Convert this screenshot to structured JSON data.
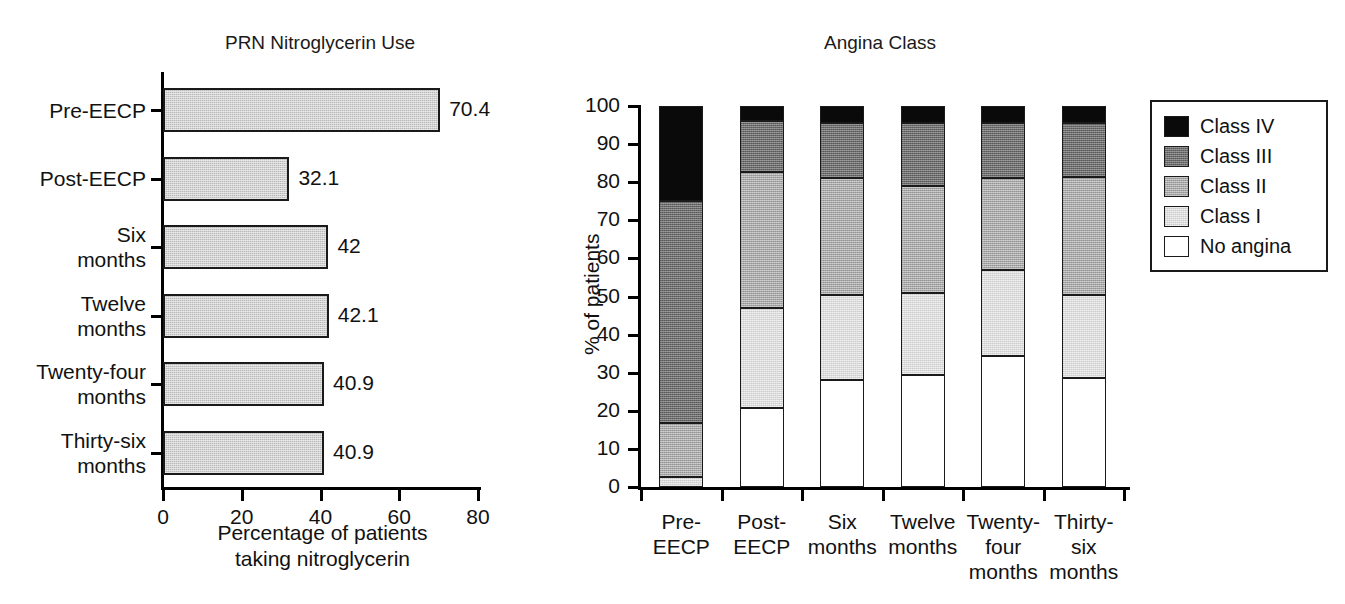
{
  "chart_data": [
    {
      "type": "bar",
      "orientation": "horizontal",
      "title": "PRN Nitroglycerin Use",
      "xlabel": "Percentage of patients taking nitroglycerin",
      "xlabel_line1": "Percentage of patients",
      "xlabel_line2": "taking nitroglycerin",
      "ylabel": "",
      "xlim": [
        0,
        80
      ],
      "xticks": [
        "0",
        "20",
        "40",
        "60",
        "80"
      ],
      "xtick_values": [
        0,
        20,
        40,
        60,
        80
      ],
      "grid": false,
      "legend": "none",
      "bar_color": "#b9b9b9",
      "categories": [
        "Pre-EECP",
        "Post-EECP",
        "Six months",
        "Twelve months",
        "Twenty-four months",
        "Thirty-six months"
      ],
      "category_lines": [
        [
          "Pre-EECP"
        ],
        [
          "Post-EECP"
        ],
        [
          "Six",
          "months"
        ],
        [
          "Twelve",
          "months"
        ],
        [
          "Twenty-four",
          "months"
        ],
        [
          "Thirty-six",
          "months"
        ]
      ],
      "values": [
        70.4,
        32.1,
        42,
        42.1,
        40.9,
        40.9
      ],
      "data_labels": [
        "70.4",
        "32.1",
        "42",
        "42.1",
        "40.9",
        "40.9"
      ]
    },
    {
      "type": "bar",
      "subtype": "stacked",
      "orientation": "vertical",
      "title": "Angina Class",
      "xlabel": "",
      "ylabel": "% of patients",
      "ylim": [
        0,
        100
      ],
      "yticks": [
        "0",
        "10",
        "20",
        "30",
        "40",
        "50",
        "60",
        "70",
        "80",
        "90",
        "100"
      ],
      "ytick_values": [
        0,
        10,
        20,
        30,
        40,
        50,
        60,
        70,
        80,
        90,
        100
      ],
      "grid": false,
      "legend_position": "right",
      "categories": [
        "Pre-EECP",
        "Post-EECP",
        "Six months",
        "Twelve months",
        "Twenty-four months",
        "Thirty-six months"
      ],
      "category_lines": [
        [
          "Pre-",
          "EECP"
        ],
        [
          "Post-",
          "EECP"
        ],
        [
          "Six",
          "months"
        ],
        [
          "Twelve",
          "months"
        ],
        [
          "Twenty-",
          "four",
          "months"
        ],
        [
          "Thirty-",
          "six",
          "months"
        ]
      ],
      "series": [
        {
          "name": "No angina",
          "color": "#ffffff",
          "swatch": "sw-0",
          "values": [
            0,
            20.8,
            28.0,
            29.4,
            34.3,
            28.6
          ]
        },
        {
          "name": "Class I",
          "color": "#dcdcdc",
          "swatch": "sw-1",
          "values": [
            2.5,
            26.2,
            22.3,
            21.6,
            22.7,
            21.7
          ]
        },
        {
          "name": "Class II",
          "color": "#a8a8a8",
          "swatch": "sw-2",
          "values": [
            14.2,
            35.7,
            30.7,
            28.0,
            24.0,
            31.0
          ]
        },
        {
          "name": "Class III",
          "color": "#6d6d6d",
          "swatch": "sw-3",
          "values": [
            58.3,
            13.3,
            14.5,
            16.5,
            14.5,
            14.2
          ]
        },
        {
          "name": "Class IV",
          "color": "#0a0a0a",
          "swatch": "sw-4",
          "values": [
            25.0,
            4.0,
            4.5,
            4.5,
            4.5,
            4.5
          ]
        }
      ],
      "cumulative_tops": [
        [
          0,
          2.5,
          16.7,
          75.0,
          100
        ],
        [
          20.8,
          47.0,
          82.7,
          96.0,
          100
        ],
        [
          28.0,
          50.3,
          81.0,
          95.5,
          100
        ],
        [
          29.4,
          51.0,
          79.0,
          95.5,
          100
        ],
        [
          34.3,
          57.0,
          81.0,
          95.5,
          100
        ],
        [
          28.6,
          50.3,
          81.3,
          95.5,
          100
        ]
      ],
      "legend_entries": [
        {
          "label": "Class IV",
          "swatch": "sw-4"
        },
        {
          "label": "Class III",
          "swatch": "sw-3"
        },
        {
          "label": "Class II",
          "swatch": "sw-2"
        },
        {
          "label": "Class I",
          "swatch": "sw-1"
        },
        {
          "label": "No angina",
          "swatch": "sw-0"
        }
      ]
    }
  ]
}
